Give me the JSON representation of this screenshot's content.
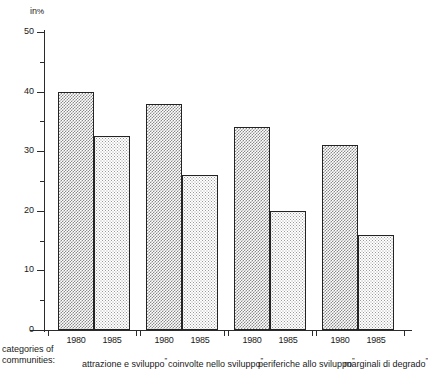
{
  "chart_data": {
    "type": "bar",
    "title": "",
    "subtitle": "",
    "xlabel": "categories of communities:",
    "ylabel": "in %",
    "ylim": [
      0,
      50
    ],
    "ytick_values": [
      0,
      10,
      20,
      30,
      40,
      50
    ],
    "ytick_labels": [
      "0",
      "10",
      "20",
      "30",
      "40",
      "50"
    ],
    "yminor_values": [
      5,
      15,
      25,
      35,
      45
    ],
    "grid": false,
    "legend_position": "below-axis",
    "categories": [
      "attrazione e sviluppo",
      "coinvolte nello sviluppo",
      "periferiche allo sviluppo",
      "marginali di degrado"
    ],
    "series": [
      {
        "name": "1980",
        "values": [
          40,
          38,
          34,
          31
        ]
      },
      {
        "name": "1985",
        "values": [
          32.5,
          26,
          20,
          16
        ]
      }
    ]
  },
  "axis": {
    "unit_prefix": "in",
    "unit_symbol": "%",
    "ytick_labels": [
      "50",
      "40",
      "30",
      "20",
      "10",
      "0"
    ]
  },
  "footer": {
    "caption_line1": "categories of",
    "caption_line2": "communities:",
    "quote_open": "”",
    "quote_close": "”"
  },
  "groups": [
    {
      "label": "attrazione e sviluppo",
      "bars": [
        {
          "year": "1980",
          "value": 40
        },
        {
          "year": "1985",
          "value": 32.5
        }
      ]
    },
    {
      "label": "coinvolte nello sviluppo",
      "bars": [
        {
          "year": "1980",
          "value": 38
        },
        {
          "year": "1985",
          "value": 26
        }
      ]
    },
    {
      "label": "periferiche allo sviluppo",
      "bars": [
        {
          "year": "1980",
          "value": 34
        },
        {
          "year": "1985",
          "value": 20
        }
      ]
    },
    {
      "label": "marginali di degrado",
      "bars": [
        {
          "year": "1980",
          "value": 31
        },
        {
          "year": "1985",
          "value": 16
        }
      ]
    }
  ],
  "colors": {
    "ink": "#232323",
    "axis": "#2b2b2b",
    "bar_1980_pattern": "#8a8a8a",
    "bar_1985_pattern": "#9a9a9a",
    "background": "#ffffff"
  }
}
